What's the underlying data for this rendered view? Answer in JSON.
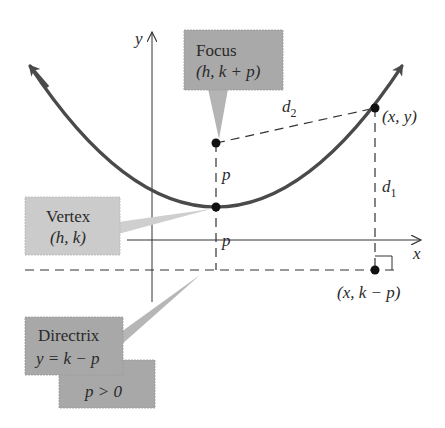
{
  "diagram": {
    "type": "parabola-focus-directrix",
    "colors": {
      "curve": "#4a4a4a",
      "axis": "#333333",
      "dash": "#333333",
      "point": "#111111",
      "callout_dark": "#a8a8a8",
      "callout_light": "#c9c9c9",
      "text": "#2a2a2a"
    },
    "axes": {
      "x_label": "x",
      "y_label": "y"
    },
    "callouts": {
      "focus": {
        "title": "Focus",
        "coords": "(h, k + p)"
      },
      "vertex": {
        "title": "Vertex",
        "coords": "(h, k)"
      },
      "directrix": {
        "title": "Directrix",
        "equation": "y = k − p"
      },
      "condition": {
        "text": "p > 0"
      }
    },
    "points": {
      "general_point": "(x, y)",
      "directrix_point": "(x, k − p)"
    },
    "segment_labels": {
      "focus_to_vertex": "p",
      "vertex_to_directrix": "p",
      "d1": "d",
      "d1_sub": "1",
      "d2": "d",
      "d2_sub": "2"
    }
  }
}
